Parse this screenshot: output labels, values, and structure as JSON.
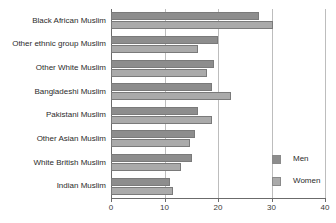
{
  "chart_data": {
    "type": "bar",
    "orientation": "horizontal",
    "title": "",
    "xlabel": "",
    "ylabel": "",
    "xlim": [
      0,
      40
    ],
    "xticks": [
      0,
      10,
      20,
      30,
      40
    ],
    "xtick_labels": [
      "0",
      "10",
      "20",
      "30",
      "40"
    ],
    "grid": "vertical",
    "legend_position": "bottom-right",
    "categories": [
      "Black African Muslim",
      "Other ethnic group Muslim",
      "Other White Muslim",
      "Bangladeshi Muslim",
      "Pakistani Muslim",
      "Other Asian Muslim",
      "White British Muslim",
      "Indian Muslim"
    ],
    "series": [
      {
        "name": "Men",
        "color": "#8d8d8d",
        "values": [
          27.7,
          20.0,
          19.2,
          18.8,
          16.2,
          15.7,
          15.2,
          11.0
        ]
      },
      {
        "name": "Women",
        "color": "#aaaaaa",
        "values": [
          30.3,
          16.3,
          17.9,
          22.4,
          18.8,
          14.8,
          13.1,
          11.5
        ]
      }
    ]
  },
  "legend": {
    "items": [
      {
        "label": "Men",
        "swatch": "men"
      },
      {
        "label": "Women",
        "swatch": "women"
      }
    ]
  }
}
